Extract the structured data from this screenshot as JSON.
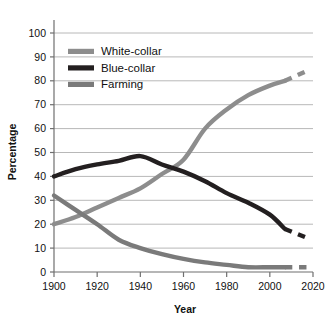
{
  "chart_data": {
    "type": "line",
    "title": "",
    "xlabel": "Year",
    "ylabel": "Percentage",
    "xlim": [
      1900,
      2020
    ],
    "ylim": [
      0,
      100
    ],
    "xticks": [
      "1900",
      "1920",
      "1940",
      "1960",
      "1980",
      "2000",
      "2020"
    ],
    "yticks": [
      "0",
      "10",
      "20",
      "30",
      "40",
      "50",
      "60",
      "70",
      "80",
      "90",
      "100"
    ],
    "grid": "horizontal",
    "legend_position": "top-left-inside",
    "series": [
      {
        "name": "White-collar",
        "color": "#8d8d8d",
        "solid": {
          "x": [
            1900,
            1910,
            1920,
            1930,
            1940,
            1950,
            1960,
            1970,
            1980,
            1990,
            2000,
            2007
          ],
          "y": [
            20,
            23,
            27,
            31,
            35,
            41,
            47,
            60,
            68,
            74,
            78,
            80
          ]
        },
        "projected": {
          "x": [
            2007,
            2018
          ],
          "y": [
            80,
            84.5
          ],
          "style": "dashed"
        }
      },
      {
        "name": "Blue-collar",
        "color": "#231f20",
        "solid": {
          "x": [
            1900,
            1910,
            1920,
            1930,
            1940,
            1950,
            1960,
            1970,
            1980,
            1990,
            2000,
            2007
          ],
          "y": [
            40,
            43,
            45,
            46.5,
            48.5,
            45,
            42,
            38,
            33,
            29,
            24,
            18
          ]
        },
        "projected": {
          "x": [
            2007,
            2018
          ],
          "y": [
            18,
            14
          ],
          "style": "dashed"
        }
      },
      {
        "name": "Farming",
        "color": "#7a7a7a",
        "solid": {
          "x": [
            1900,
            1910,
            1920,
            1930,
            1940,
            1950,
            1960,
            1970,
            1980,
            1990,
            2000,
            2007
          ],
          "y": [
            32,
            26,
            20,
            13.5,
            10,
            7.5,
            5.5,
            4,
            3,
            2,
            2,
            2
          ]
        },
        "projected": {
          "x": [
            2007,
            2018
          ],
          "y": [
            2,
            2
          ],
          "style": "dashed"
        }
      }
    ]
  },
  "legend": {
    "items": [
      {
        "label": "White-collar",
        "color": "#8d8d8d"
      },
      {
        "label": "Blue-collar",
        "color": "#231f20"
      },
      {
        "label": "Farming",
        "color": "#7a7a7a"
      }
    ]
  },
  "axes": {
    "x_title": "Year",
    "y_title": "Percentage"
  },
  "colors": {
    "gridline": "#b8b8b8",
    "axis": "#6f6f6f",
    "text": "#111111",
    "background": "#ffffff"
  }
}
